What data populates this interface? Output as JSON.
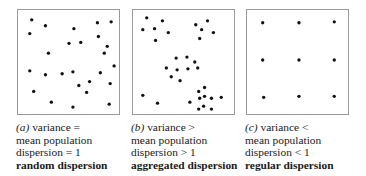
{
  "panels": [
    {
      "id": "a",
      "left": 17,
      "label": "(a)",
      "line1": " variance =",
      "line2": "mean population",
      "line3": "dispersion = 1",
      "line4": "random dispersion",
      "dots": [
        [
          14,
          10
        ],
        [
          28,
          16
        ],
        [
          57,
          19
        ],
        [
          81,
          13
        ],
        [
          95,
          12
        ],
        [
          12,
          24
        ],
        [
          82,
          27
        ],
        [
          52,
          34
        ],
        [
          64,
          33
        ],
        [
          91,
          37
        ],
        [
          31,
          44
        ],
        [
          88,
          44
        ],
        [
          12,
          62
        ],
        [
          28,
          66
        ],
        [
          45,
          65
        ],
        [
          56,
          63
        ],
        [
          84,
          64
        ],
        [
          98,
          57
        ],
        [
          62,
          77
        ],
        [
          73,
          73
        ],
        [
          94,
          75
        ],
        [
          16,
          83
        ],
        [
          70,
          84
        ],
        [
          34,
          94
        ],
        [
          56,
          99
        ],
        [
          93,
          96
        ]
      ]
    },
    {
      "id": "b",
      "left": 132,
      "label": "(b)",
      "line1": " variance >",
      "line2": "mean population",
      "line3": "dispersion > 1",
      "line4": "aggregated dispersion",
      "dots": [
        [
          14,
          8
        ],
        [
          30,
          11
        ],
        [
          10,
          20
        ],
        [
          22,
          19
        ],
        [
          36,
          23
        ],
        [
          23,
          31
        ],
        [
          64,
          15
        ],
        [
          76,
          11
        ],
        [
          70,
          20
        ],
        [
          82,
          23
        ],
        [
          68,
          29
        ],
        [
          44,
          49
        ],
        [
          55,
          48
        ],
        [
          63,
          53
        ],
        [
          34,
          59
        ],
        [
          45,
          61
        ],
        [
          56,
          60
        ],
        [
          66,
          59
        ],
        [
          39,
          68
        ],
        [
          48,
          72
        ],
        [
          10,
          87
        ],
        [
          25,
          95
        ],
        [
          58,
          94
        ],
        [
          67,
          83
        ],
        [
          73,
          79
        ],
        [
          68,
          90
        ],
        [
          73,
          88
        ],
        [
          80,
          90
        ],
        [
          90,
          89
        ],
        [
          72,
          98
        ],
        [
          67,
          101
        ],
        [
          80,
          101
        ]
      ]
    },
    {
      "id": "c",
      "left": 246,
      "label": "(c)",
      "line1": " variance <",
      "line2": "mean population",
      "line3": "dispersion < 1",
      "line4": "regular dispersion",
      "dots": [
        [
          16,
          13
        ],
        [
          53,
          13
        ],
        [
          89,
          12
        ],
        [
          16,
          51
        ],
        [
          53,
          51
        ],
        [
          89,
          51
        ],
        [
          17,
          89
        ],
        [
          53,
          88
        ],
        [
          89,
          88
        ]
      ]
    }
  ]
}
